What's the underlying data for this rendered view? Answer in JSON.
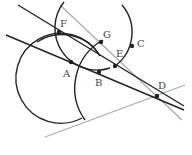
{
  "diagram": {
    "type": "geometry",
    "points": [
      {
        "label": "F",
        "x": 59,
        "y": 32,
        "lx": 60,
        "ly": 27
      },
      {
        "label": "G",
        "x": 101,
        "y": 42,
        "lx": 103,
        "ly": 38
      },
      {
        "label": "A",
        "x": 71,
        "y": 62,
        "lx": 63,
        "ly": 77
      },
      {
        "label": "B",
        "x": 99,
        "y": 72,
        "lx": 95,
        "ly": 86
      },
      {
        "label": "E",
        "x": 115,
        "y": 66,
        "lx": 116,
        "ly": 57
      },
      {
        "label": "C",
        "x": 132,
        "y": 46,
        "lx": 137,
        "ly": 47
      },
      {
        "label": "D",
        "x": 157,
        "y": 96,
        "lx": 158,
        "ly": 89
      }
    ],
    "colors": {
      "line": "#222222",
      "gray": "#aaaaaa",
      "text": "#444444"
    }
  }
}
